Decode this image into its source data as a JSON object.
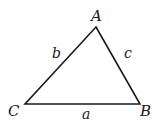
{
  "diagram": {
    "type": "triangle",
    "vertices": [
      {
        "label": "A",
        "x": 96,
        "y": 27
      },
      {
        "label": "B",
        "x": 140,
        "y": 104
      },
      {
        "label": "C",
        "x": 25,
        "y": 104
      }
    ],
    "sides": [
      {
        "label": "a",
        "between": "B-C"
      },
      {
        "label": "b",
        "between": "A-C"
      },
      {
        "label": "c",
        "between": "A-B"
      }
    ],
    "stroke_color": "#1a1a1a"
  }
}
